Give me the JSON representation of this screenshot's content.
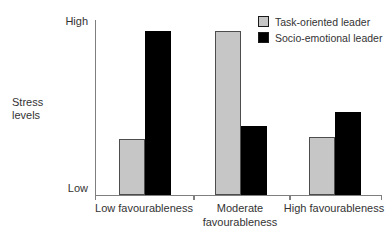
{
  "chart_data": {
    "type": "bar",
    "title": "",
    "categories": [
      "Low favourableness",
      "Moderate favourableness",
      "High favourableness"
    ],
    "series": [
      {
        "name": "Task-oriented leader",
        "color": "#c6c6c6",
        "values": [
          0.32,
          0.93,
          0.33
        ]
      },
      {
        "name": "Socio-emotional leader",
        "color": "#000000",
        "values": [
          0.93,
          0.39,
          0.47
        ]
      }
    ],
    "xlabel": "",
    "ylabel": "Stress levels",
    "y_tick_labels": [
      "High",
      "Low"
    ],
    "ylim": [
      0,
      1
    ],
    "grid": false,
    "legend_position": "top-right",
    "axis_color": "#7f7f7f",
    "text_color": "#333333",
    "background": "#ffffff"
  }
}
